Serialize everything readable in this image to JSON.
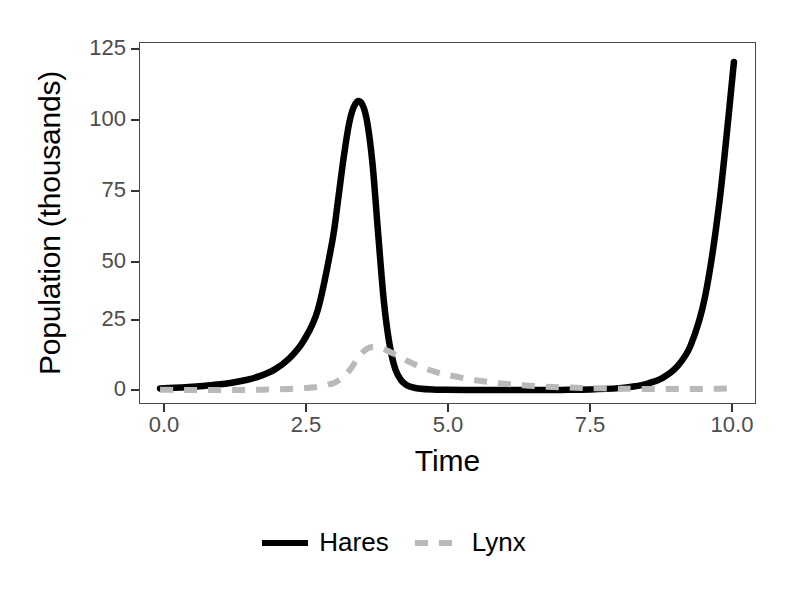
{
  "chart_data": {
    "type": "line",
    "title": "",
    "subtitle": "",
    "xlabel": "Time",
    "ylabel": "Population (thousands)",
    "xlim": [
      -0.35,
      10.35
    ],
    "ylim": [
      -4,
      128
    ],
    "xticks": [
      "0.0",
      "2.5",
      "5.0",
      "7.5",
      "10.0"
    ],
    "xtick_values": [
      0.0,
      2.5,
      5.0,
      7.5,
      10.0
    ],
    "yticks": [
      "0",
      "25",
      "50",
      "75",
      "100",
      "125"
    ],
    "ytick_values": [
      0,
      25,
      50,
      75,
      100,
      125
    ],
    "grid": false,
    "legend_position": "bottom",
    "x": [
      0.0,
      0.25,
      0.5,
      0.75,
      1.0,
      1.25,
      1.5,
      1.75,
      2.0,
      2.25,
      2.5,
      2.75,
      3.0,
      3.1,
      3.2,
      3.3,
      3.4,
      3.5,
      3.6,
      3.7,
      3.8,
      3.9,
      4.0,
      4.1,
      4.2,
      4.3,
      4.4,
      4.5,
      4.75,
      5.0,
      5.5,
      6.0,
      6.5,
      7.0,
      7.5,
      8.0,
      8.25,
      8.5,
      8.75,
      9.0,
      9.25,
      9.5,
      9.75,
      10.0
    ],
    "series": [
      {
        "name": "Hares",
        "color": "#000000",
        "linetype": "solid",
        "values": [
          1.0,
          1.2,
          1.5,
          1.9,
          2.4,
          3.1,
          4.1,
          5.6,
          8.0,
          12.0,
          18.5,
          30.0,
          55.0,
          70.0,
          86.0,
          99.0,
          105.5,
          106.2,
          100.0,
          84.0,
          58.0,
          33.0,
          17.0,
          8.0,
          4.0,
          2.2,
          1.4,
          1.0,
          0.6,
          0.5,
          0.4,
          0.4,
          0.4,
          0.45,
          0.6,
          1.1,
          1.7,
          2.8,
          4.8,
          8.8,
          17.0,
          35.0,
          70.0,
          121.0
        ]
      },
      {
        "name": "Lynx",
        "color": "#b9b9b9",
        "linetype": "dashed",
        "values": [
          0.5,
          0.45,
          0.42,
          0.4,
          0.4,
          0.42,
          0.46,
          0.52,
          0.62,
          0.8,
          1.1,
          1.6,
          2.8,
          3.8,
          5.3,
          7.6,
          10.6,
          13.6,
          15.5,
          16.2,
          16.0,
          15.4,
          14.5,
          13.4,
          12.3,
          11.2,
          10.2,
          9.3,
          7.4,
          6.0,
          4.0,
          2.7,
          1.9,
          1.4,
          1.1,
          0.9,
          0.85,
          0.8,
          0.78,
          0.76,
          0.78,
          0.82,
          0.9,
          1.1
        ]
      }
    ]
  },
  "legend": {
    "items": [
      {
        "label": "Hares",
        "key": "solid-line-key"
      },
      {
        "label": "Lynx",
        "key": "dashed-line-key"
      }
    ]
  },
  "colors": {
    "hares": "#000000",
    "lynx": "#b9b9b9",
    "axis": "#4a4a4a",
    "tick_text": "#4d4d4d",
    "background": "#ffffff"
  }
}
